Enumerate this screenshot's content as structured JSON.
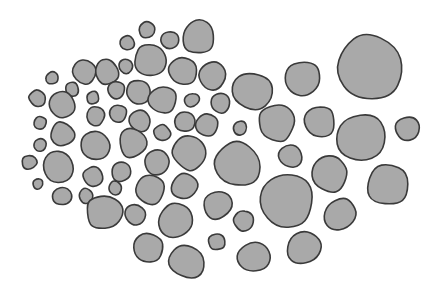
{
  "diagram": {
    "type": "packed-blobs",
    "fill_color": "#a9a9a9",
    "stroke_color": "#3a3a3a",
    "background": "#ffffff",
    "blobs": [
      {
        "cx": 199,
        "cy": 37,
        "r": 18
      },
      {
        "cx": 147,
        "cy": 30,
        "r": 9
      },
      {
        "cx": 127,
        "cy": 43,
        "r": 8
      },
      {
        "cx": 170,
        "cy": 40,
        "r": 10
      },
      {
        "cx": 150,
        "cy": 60,
        "r": 17
      },
      {
        "cx": 183,
        "cy": 71,
        "r": 16
      },
      {
        "cx": 213,
        "cy": 77,
        "r": 16
      },
      {
        "cx": 252,
        "cy": 91,
        "r": 22
      },
      {
        "cx": 302,
        "cy": 78,
        "r": 18
      },
      {
        "cx": 369,
        "cy": 68,
        "r": 36
      },
      {
        "cx": 52,
        "cy": 78,
        "r": 7
      },
      {
        "cx": 84,
        "cy": 72,
        "r": 13
      },
      {
        "cx": 107,
        "cy": 72,
        "r": 13
      },
      {
        "cx": 126,
        "cy": 66,
        "r": 8
      },
      {
        "cx": 72,
        "cy": 89,
        "r": 8
      },
      {
        "cx": 37,
        "cy": 98,
        "r": 9
      },
      {
        "cx": 62,
        "cy": 105,
        "r": 14
      },
      {
        "cx": 93,
        "cy": 98,
        "r": 7
      },
      {
        "cx": 116,
        "cy": 90,
        "r": 10
      },
      {
        "cx": 138,
        "cy": 92,
        "r": 13
      },
      {
        "cx": 163,
        "cy": 100,
        "r": 15
      },
      {
        "cx": 192,
        "cy": 100,
        "r": 8
      },
      {
        "cx": 221,
        "cy": 103,
        "r": 11
      },
      {
        "cx": 96,
        "cy": 116,
        "r": 10
      },
      {
        "cx": 118,
        "cy": 113,
        "r": 10
      },
      {
        "cx": 140,
        "cy": 121,
        "r": 12
      },
      {
        "cx": 40,
        "cy": 123,
        "r": 7
      },
      {
        "cx": 62,
        "cy": 134,
        "r": 13
      },
      {
        "cx": 96,
        "cy": 146,
        "r": 16
      },
      {
        "cx": 132,
        "cy": 143,
        "r": 16
      },
      {
        "cx": 162,
        "cy": 133,
        "r": 9
      },
      {
        "cx": 185,
        "cy": 122,
        "r": 11
      },
      {
        "cx": 207,
        "cy": 125,
        "r": 12
      },
      {
        "cx": 240,
        "cy": 128,
        "r": 8
      },
      {
        "cx": 278,
        "cy": 122,
        "r": 20
      },
      {
        "cx": 320,
        "cy": 122,
        "r": 17
      },
      {
        "cx": 360,
        "cy": 137,
        "r": 27
      },
      {
        "cx": 408,
        "cy": 129,
        "r": 14
      },
      {
        "cx": 40,
        "cy": 145,
        "r": 7
      },
      {
        "cx": 29,
        "cy": 162,
        "r": 8
      },
      {
        "cx": 58,
        "cy": 167,
        "r": 18
      },
      {
        "cx": 38,
        "cy": 184,
        "r": 6
      },
      {
        "cx": 62,
        "cy": 196,
        "r": 10
      },
      {
        "cx": 93,
        "cy": 177,
        "r": 11
      },
      {
        "cx": 121,
        "cy": 172,
        "r": 11
      },
      {
        "cx": 157,
        "cy": 163,
        "r": 13
      },
      {
        "cx": 189,
        "cy": 152,
        "r": 19
      },
      {
        "cx": 237,
        "cy": 165,
        "r": 25
      },
      {
        "cx": 290,
        "cy": 156,
        "r": 13
      },
      {
        "cx": 330,
        "cy": 174,
        "r": 19
      },
      {
        "cx": 387,
        "cy": 185,
        "r": 23
      },
      {
        "cx": 86,
        "cy": 196,
        "r": 8
      },
      {
        "cx": 115,
        "cy": 188,
        "r": 8
      },
      {
        "cx": 104,
        "cy": 212,
        "r": 19
      },
      {
        "cx": 150,
        "cy": 190,
        "r": 16
      },
      {
        "cx": 184,
        "cy": 186,
        "r": 15
      },
      {
        "cx": 218,
        "cy": 205,
        "r": 16
      },
      {
        "cx": 287,
        "cy": 200,
        "r": 28
      },
      {
        "cx": 340,
        "cy": 215,
        "r": 17
      },
      {
        "cx": 136,
        "cy": 215,
        "r": 12
      },
      {
        "cx": 176,
        "cy": 220,
        "r": 19
      },
      {
        "cx": 244,
        "cy": 220,
        "r": 11
      },
      {
        "cx": 148,
        "cy": 248,
        "r": 16
      },
      {
        "cx": 187,
        "cy": 262,
        "r": 20
      },
      {
        "cx": 217,
        "cy": 242,
        "r": 9
      },
      {
        "cx": 254,
        "cy": 257,
        "r": 18
      },
      {
        "cx": 304,
        "cy": 248,
        "r": 18
      }
    ]
  }
}
